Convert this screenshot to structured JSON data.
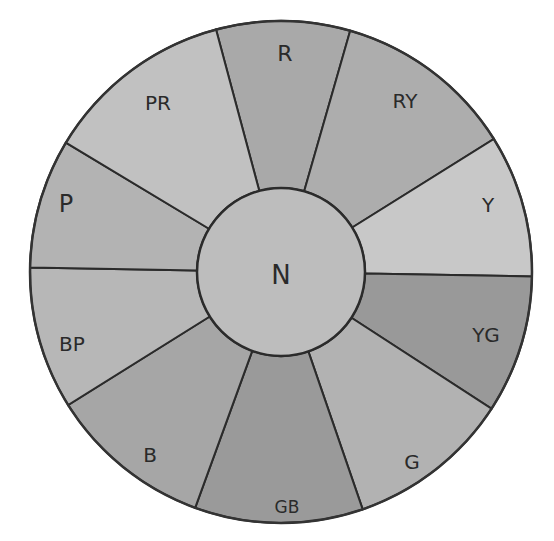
{
  "diagram": {
    "type": "color-wheel",
    "center_label": "N",
    "sectors": [
      {
        "label": "R",
        "fill": "#a9a9a9",
        "a0": -105,
        "a1": -74,
        "lx": 285,
        "ly": 55,
        "fs": 22
      },
      {
        "label": "RY",
        "fill": "#adadad",
        "a0": -74,
        "a1": -32,
        "lx": 405,
        "ly": 102,
        "fs": 20
      },
      {
        "label": "Y",
        "fill": "#c8c8c8",
        "a0": -32,
        "a1": 1,
        "lx": 488,
        "ly": 206,
        "fs": 20
      },
      {
        "label": "YG",
        "fill": "#999999",
        "a0": 1,
        "a1": 33,
        "lx": 486,
        "ly": 336,
        "fs": 20
      },
      {
        "label": "G",
        "fill": "#b2b2b2",
        "a0": 33,
        "a1": 71,
        "lx": 412,
        "ly": 463,
        "fs": 20
      },
      {
        "label": "GB",
        "fill": "#9a9a9a",
        "a0": 71,
        "a1": 110,
        "lx": 287,
        "ly": 508,
        "fs": 17
      },
      {
        "label": "B",
        "fill": "#a6a6a6",
        "a0": 110,
        "a1": 148,
        "lx": 150,
        "ly": 456,
        "fs": 20
      },
      {
        "label": "BP",
        "fill": "#b7b7b7",
        "a0": 148,
        "a1": 181,
        "lx": 72,
        "ly": 345,
        "fs": 20
      },
      {
        "label": "P",
        "fill": "#b3b3b3",
        "a0": 181,
        "a1": 211,
        "lx": 66,
        "ly": 205,
        "fs": 24
      },
      {
        "label": "PR",
        "fill": "#c1c1c1",
        "a0": 211,
        "a1": 255,
        "lx": 158,
        "ly": 104,
        "fs": 20
      }
    ],
    "inner_fill": "#bdbdbd"
  }
}
